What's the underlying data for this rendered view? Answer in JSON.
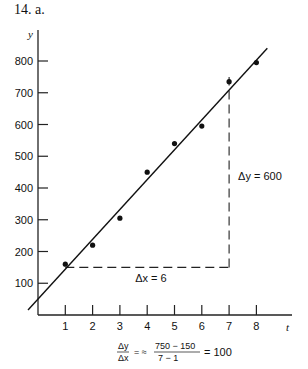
{
  "problem_label": "14.   a.",
  "chart_data": {
    "type": "scatter",
    "title": "",
    "xlabel": "t",
    "ylabel": "y",
    "x_ticks": [
      1,
      2,
      3,
      4,
      5,
      6,
      7,
      8
    ],
    "y_ticks": [
      100,
      200,
      300,
      400,
      500,
      600,
      700,
      800
    ],
    "xlim": [
      0,
      8.8
    ],
    "ylim": [
      0,
      880
    ],
    "grid": false,
    "series": [
      {
        "name": "data points",
        "x": [
          1,
          2,
          3,
          4,
          5,
          6,
          7,
          8
        ],
        "y": [
          160,
          220,
          305,
          450,
          540,
          595,
          735,
          795
        ]
      }
    ],
    "fit_line": {
      "x": [
        0,
        8.4
      ],
      "y": [
        50,
        840
      ]
    },
    "delta_triangle": {
      "x0": 1,
      "y0": 150,
      "x1": 7,
      "y1": 750,
      "dx_label": "Δx = 6",
      "dy_label": "Δy = 600"
    },
    "formula": {
      "lhs_num": "Δy",
      "lhs_den": "Δx",
      "approx": "= ≈",
      "num": "750  −  150",
      "den": "7   −   1",
      "result": "=  100"
    }
  }
}
